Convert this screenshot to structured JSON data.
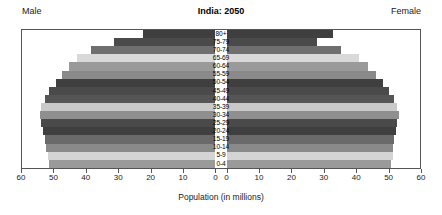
{
  "chart_data": {
    "type": "bar",
    "subtype": "population-pyramid",
    "title": "India: 2050",
    "xlabel": "Population (in millions)",
    "ylabel": "",
    "left_label": "Male",
    "right_label": "Female",
    "xlim": [
      0,
      60
    ],
    "xticks": [
      60,
      50,
      40,
      30,
      20,
      10,
      0,
      0,
      10,
      20,
      30,
      40,
      50,
      60
    ],
    "grid": false,
    "legend": "none",
    "categories": [
      "80+",
      "75-79",
      "70-74",
      "65-69",
      "60-64",
      "55-59",
      "50-54",
      "45-49",
      "40-44",
      "35-39",
      "30-34",
      "25-29",
      "20-24",
      "15-19",
      "10-14",
      "5-9",
      "0-4"
    ],
    "series": [
      {
        "name": "Male",
        "values": [
          22.5,
          31.5,
          38.5,
          43.0,
          45.5,
          47.5,
          49.5,
          51.5,
          53.0,
          54.0,
          54.5,
          54.0,
          53.5,
          53.0,
          52.5,
          52.0,
          51.5
        ]
      },
      {
        "name": "Female",
        "values": [
          33.0,
          28.0,
          35.5,
          41.0,
          44.0,
          46.5,
          48.5,
          50.5,
          52.0,
          53.0,
          53.5,
          53.0,
          52.5,
          52.0,
          51.5,
          51.5,
          51.0
        ]
      }
    ],
    "bar_colors": [
      "#3f3f3f",
      "#4a4a4a",
      "#6f6f6f",
      "#d9d9d9",
      "#9a9a9a",
      "#8a8a8a",
      "#3f3f3f",
      "#4a4a4a",
      "#555555",
      "#c9c9c9",
      "#8f8f8f",
      "#4a4a4a",
      "#3f3f3f",
      "#6a6a6a",
      "#8a8a8a",
      "#d4d4d4",
      "#9a9a9a"
    ]
  },
  "colors": {
    "frame": "#555555",
    "background": "#ffffff",
    "text": "#1a1a1a"
  }
}
